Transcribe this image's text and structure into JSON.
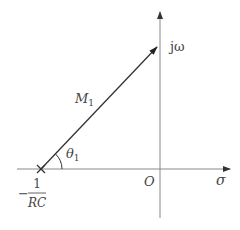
{
  "diagram": {
    "type": "s-plane pole vector",
    "axes": {
      "vertical_label": "jω",
      "horizontal_label": "σ",
      "origin_label": "O"
    },
    "pole": {
      "marker": "×",
      "label_sign": "−",
      "label_numerator": "1",
      "label_denominator": "RC"
    },
    "vector": {
      "label": "M",
      "label_subscript": "1"
    },
    "angle": {
      "label": "θ",
      "label_subscript": "1"
    },
    "colors": {
      "axis": "#777777",
      "vector": "#333333",
      "text": "#444444"
    }
  }
}
